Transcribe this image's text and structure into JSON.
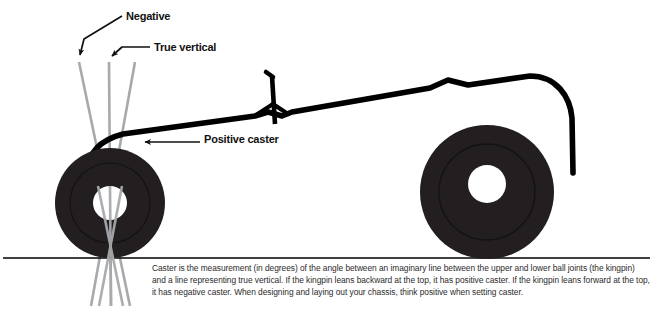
{
  "figure": {
    "labels": {
      "negative": "Negative",
      "true_vertical": "True vertical",
      "positive_caster": "Positive caster"
    },
    "caption": "Caster is the measurement (in degrees) of the angle between an imaginary line between the upper and lower ball joints (the kingpin) and a line representing true vertical. If the kingpin leans backward at the top, it has positive caster. If the kingpin leans forward at the top, it has negative caster. When designing and laying out your chassis, think positive when setting caster.",
    "colors": {
      "background": "#ffffff",
      "tire": "#231f20",
      "hub": "#ffffff",
      "chassis": "#000000",
      "guide_line": "#a7a9ac",
      "ground_line": "#000000",
      "label_text": "#111111",
      "caption_text": "#2b2b2b"
    }
  }
}
